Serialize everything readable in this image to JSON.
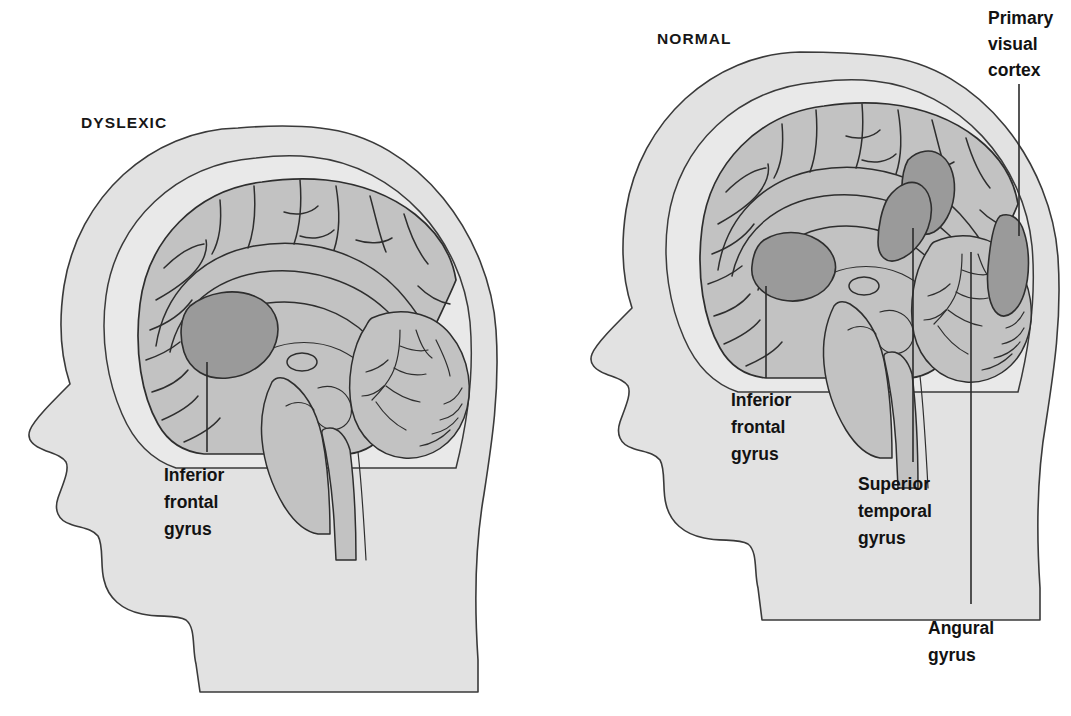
{
  "figure": {
    "title_dyslexic": "DYSLEXIC",
    "title_normal": "NORMAL",
    "background_color": "#ffffff",
    "head_fill": "#e2e2e2",
    "brain_fill": "#c2c2c2",
    "highlight_fill": "#9a9a9a",
    "outline_color": "#2e2e2e"
  },
  "panels": {
    "left": {
      "heading": "DYSLEXIC",
      "callouts": [
        {
          "id": "ifg-left",
          "name": "inferior-frontal-gyrus",
          "lines": [
            "Inferior",
            "frontal",
            "gyrus"
          ],
          "align": "start"
        }
      ]
    },
    "right": {
      "heading": "NORMAL",
      "callouts": [
        {
          "id": "ifg-right",
          "name": "inferior-frontal-gyrus",
          "lines": [
            "Inferior",
            "frontal",
            "gyrus"
          ],
          "align": "start"
        },
        {
          "id": "stg-right",
          "name": "superior-temporal-gyrus",
          "lines": [
            "Superior",
            "temporal",
            "gyrus"
          ],
          "align": "start"
        },
        {
          "id": "pvc-right",
          "name": "primary-visual-cortex",
          "lines": [
            "Primary",
            "visual",
            "cortex"
          ],
          "align": "start"
        },
        {
          "id": "ang-right",
          "name": "angular-gyrus",
          "lines": [
            "Angural",
            "gyrus"
          ],
          "align": "start"
        }
      ]
    }
  },
  "labels": {
    "dyslexic_heading": "DYSLEXIC",
    "normal_heading": "NORMAL",
    "l_ifg_1": "Inferior",
    "l_ifg_2": "frontal",
    "l_ifg_3": "gyrus",
    "r_ifg_1": "Inferior",
    "r_ifg_2": "frontal",
    "r_ifg_3": "gyrus",
    "r_stg_1": "Superior",
    "r_stg_2": "temporal",
    "r_stg_3": "gyrus",
    "r_pvc_1": "Primary",
    "r_pvc_2": "visual",
    "r_pvc_3": "cortex",
    "r_ang_1": "Angural",
    "r_ang_2": "gyrus"
  }
}
